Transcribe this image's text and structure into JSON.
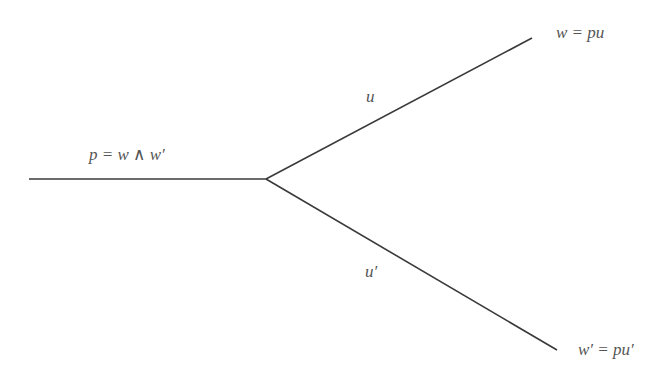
{
  "diagram": {
    "type": "tree-branch",
    "line_color": "#3a3a3a",
    "text_color": "#555555",
    "nodes": {
      "root_label": "p = w ∧ w′",
      "top_label": "w = pu",
      "bottom_label": "w′ = pu′"
    },
    "edges": {
      "root_edge": {
        "from": [
          29,
          179
        ],
        "to": [
          266,
          179
        ]
      },
      "top_edge": {
        "from": [
          266,
          179
        ],
        "to": [
          532,
          38
        ],
        "label": "u"
      },
      "bottom_edge": {
        "from": [
          266,
          179
        ],
        "to": [
          557,
          350
        ],
        "label": "u′"
      }
    }
  }
}
